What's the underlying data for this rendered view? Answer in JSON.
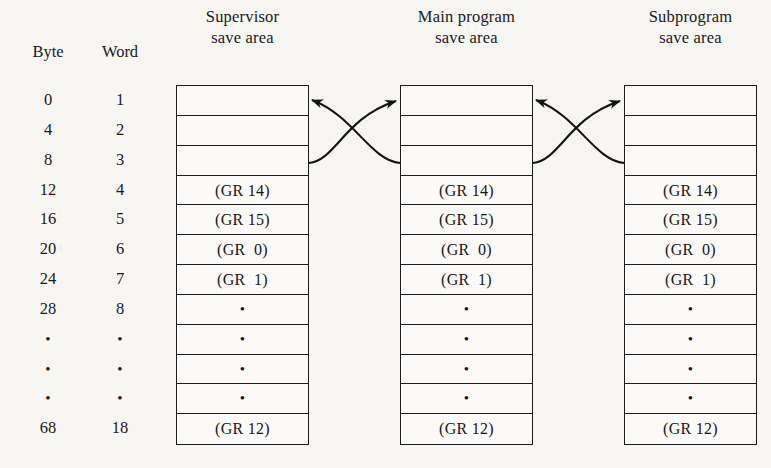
{
  "diagram": {
    "index_headers": {
      "byte": "Byte",
      "word": "Word"
    },
    "byte_offsets": [
      "0",
      "4",
      "8",
      "12",
      "16",
      "20",
      "24",
      "28",
      "•",
      "•",
      "•",
      "68"
    ],
    "word_numbers": [
      "1",
      "2",
      "3",
      "4",
      "5",
      "6",
      "7",
      "8",
      "•",
      "•",
      "•",
      "18"
    ],
    "save_areas": [
      {
        "id": "supervisor",
        "header_line1": "Supervisor",
        "header_line2": "save area",
        "rows": [
          "",
          "",
          "",
          "(GR 14)",
          "(GR 15)",
          "(GR  0)",
          "(GR  1)",
          "•",
          "•",
          "•",
          "•",
          "(GR 12)"
        ]
      },
      {
        "id": "main-program",
        "header_line1": "Main program",
        "header_line2": "save area",
        "rows": [
          "",
          "",
          "",
          "(GR 14)",
          "(GR 15)",
          "(GR  0)",
          "(GR  1)",
          "•",
          "•",
          "•",
          "•",
          "(GR 12)"
        ]
      },
      {
        "id": "subprogram",
        "header_line1": "Subprogram",
        "header_line2": "save area",
        "rows": [
          "",
          "",
          "",
          "(GR 14)",
          "(GR 15)",
          "(GR  0)",
          "(GR  1)",
          "•",
          "•",
          "•",
          "•",
          "(GR 12)"
        ]
      }
    ],
    "links": [
      {
        "name": "supervisor-back-pointer",
        "from": "main-program.row3",
        "to": "supervisor.row1"
      },
      {
        "name": "supervisor-forward-pointer",
        "from": "supervisor.row3",
        "to": "main-program.row1"
      },
      {
        "name": "main-back-pointer",
        "from": "subprogram.row3",
        "to": "main-program.row1"
      },
      {
        "name": "main-forward-pointer",
        "from": "main-program.row3",
        "to": "subprogram.row1"
      }
    ],
    "colors": {
      "ink": "#1c1c1c",
      "page": "#f7f6f3",
      "cell": "#fbfaf8"
    }
  }
}
